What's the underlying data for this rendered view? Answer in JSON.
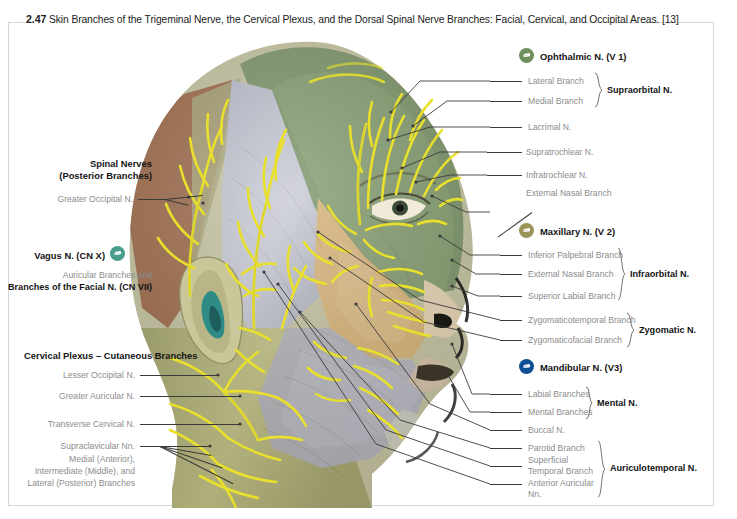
{
  "caption": {
    "figure_number": "2.47",
    "text": "Skin Branches of the Trigeminal Nerve, the Cervical Plexus, and the Dorsal Spinal Nerve Branches: Facial, Cervical, and Occipital Areas. [13]"
  },
  "colors": {
    "ophthalmic_icon": "#6f8f5c",
    "maxillary_icon": "#9b9358",
    "mandibular_icon": "#0d4f95",
    "vagus_icon": "#4a9c8c",
    "label_gray": "#8c8c8c",
    "label_black": "#141414",
    "leader_line": "#3a3a3a",
    "frame": "#d8d8d8",
    "nerve_yellow": "#e8e02c",
    "zone_forehead_green": "#7c9468",
    "zone_maxillary_tan": "#d6b378",
    "zone_temporal_gray": "#b9bccb",
    "zone_occipital_brown": "#9d6a4a",
    "zone_neck_olive": "#b8b87a",
    "ear_concha_teal": "#2e8b86"
  },
  "left_groups": [
    {
      "id": "spinal-nerves",
      "header": [
        "Spinal Nerves",
        "(Posterior Branches)"
      ],
      "items": [
        {
          "label": "Greater Occipital N."
        }
      ]
    },
    {
      "id": "vagus",
      "header_inline": "Vagus N. (CN X)",
      "icon": "vagus-icon",
      "icon_color": "#4a9c8c",
      "subtitle": [
        "Auricular Branches and",
        "Branches of the Facial N. (CN VII)"
      ]
    },
    {
      "id": "cervical-plexus",
      "header": [
        "Cervical Plexus – Cutaneous Branches"
      ],
      "items": [
        {
          "label": "Lesser Occipital N."
        },
        {
          "label": "Greater Auricular N."
        },
        {
          "label": "Transverse Cervical N."
        },
        {
          "label": "Supraclavicular Nn."
        }
      ],
      "sublines": [
        "Medial (Anterior),",
        "Intermediate (Middle), and",
        "Lateral (Posterior) Branches"
      ]
    }
  ],
  "right_groups": [
    {
      "id": "ophthalmic",
      "title": "Ophthalmic N. (V 1)",
      "icon": "ophthalmic-icon",
      "icon_color": "#6f8f5c",
      "items": [
        {
          "label": "Lateral Branch",
          "group": "Supraorbital N."
        },
        {
          "label": "Medial Branch",
          "group": "Supraorbital N."
        },
        {
          "label": "Lacrimal N."
        },
        {
          "label": "Supratrochlear N."
        },
        {
          "label": "Infratrochlear N."
        },
        {
          "label": "External Nasal Branch"
        }
      ],
      "group_labels": [
        "Supraorbital N."
      ]
    },
    {
      "id": "maxillary",
      "title": "Maxillary N. (V 2)",
      "icon": "maxillary-icon",
      "icon_color": "#9b9358",
      "items": [
        {
          "label": "Inferior Palpebral Branch",
          "group": "Infraorbital N."
        },
        {
          "label": "External Nasal Branch",
          "group": "Infraorbital N."
        },
        {
          "label": "Superior Labial Branch",
          "group": "Infraorbital N."
        },
        {
          "label": "Zygomaticotemporal Branch",
          "group": "Zygomatic N."
        },
        {
          "label": "Zygomaticofacial Branch",
          "group": "Zygomatic N."
        }
      ],
      "group_labels": [
        "Infraorbital N.",
        "Zygomatic N."
      ]
    },
    {
      "id": "mandibular",
      "title": "Mandibular N. (V3)",
      "icon": "mandibular-icon",
      "icon_color": "#0d4f95",
      "items": [
        {
          "label": "Labial Branches",
          "group": "Mental N."
        },
        {
          "label": "Mental Branches",
          "group": "Mental N."
        },
        {
          "label": "Buccal N."
        },
        {
          "label": "Parotid Branch",
          "group": "Auriculotemporal N."
        },
        {
          "label": "Superficial",
          "group": "Auriculotemporal N."
        },
        {
          "label": "Temporal Branch",
          "group": "Auriculotemporal N."
        },
        {
          "label": "Anterior Auricular",
          "group": "Auriculotemporal N."
        },
        {
          "label": "Nn.",
          "group": "Auriculotemporal N."
        }
      ],
      "group_labels": [
        "Mental N.",
        "Auriculotemporal N."
      ]
    }
  ],
  "flat_right_labels": {
    "ophthalmic_title": "Ophthalmic N. (V 1)",
    "lateral_branch": "Lateral Branch",
    "medial_branch": "Medial Branch",
    "supraorbital": "Supraorbital N.",
    "lacrimal": "Lacrimal N.",
    "supratrochlear": "Supratrochlear N.",
    "infratrochlear": "Infratrochlear N.",
    "external_nasal_1": "External Nasal Branch",
    "maxillary_title": "Maxillary N. (V 2)",
    "inferior_palpebral": "Inferior Palpebral Branch",
    "external_nasal_2": "External Nasal Branch",
    "superior_labial": "Superior Labial Branch",
    "infraorbital": "Infraorbital N.",
    "zygomaticotemporal": "Zygomaticotemporal Branch",
    "zygomaticofacial": "Zygomaticofacial Branch",
    "zygomatic": "Zygomatic N.",
    "mandibular_title": "Mandibular N. (V3)",
    "labial_branches": "Labial Branches",
    "mental_branches": "Mental Branches",
    "mental": "Mental N.",
    "buccal": "Buccal N.",
    "parotid_branch": "Parotid Branch",
    "superficial": "Superficial",
    "temporal_branch": "Temporal Branch",
    "anterior_auricular": "Anterior Auricular",
    "nn": "Nn.",
    "auriculotemporal": "Auriculotemporal N."
  },
  "flat_left_labels": {
    "spinal_nerves_1": "Spinal Nerves",
    "spinal_nerves_2": "(Posterior Branches)",
    "greater_occipital": "Greater Occipital N.",
    "vagus_title": "Vagus N. (CN X)",
    "auricular_branches": "Auricular Branches and",
    "facial_branches": "Branches of the Facial N. (CN VII)",
    "cervical_plexus_header": "Cervical Plexus – Cutaneous Branches",
    "lesser_occipital": "Lesser Occipital N.",
    "greater_auricular": "Greater Auricular N.",
    "transverse_cervical": "Transverse Cervical N.",
    "supraclavicular": "Supraclavicular Nn.",
    "supra_sub1": "Medial (Anterior),",
    "supra_sub2": "Intermediate (Middle), and",
    "supra_sub3": "Lateral (Posterior) Branches"
  }
}
